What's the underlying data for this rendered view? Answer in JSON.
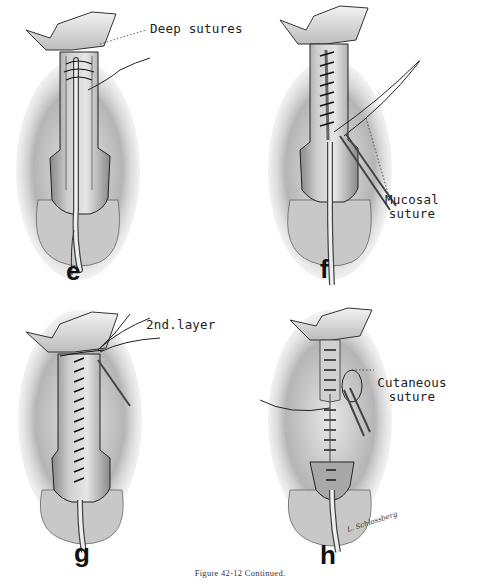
{
  "figure": {
    "caption": "Figure 42-12 Continued.",
    "panels": [
      {
        "id": "e",
        "letter": "e",
        "annotation": "Deep sutures"
      },
      {
        "id": "f",
        "letter": "f",
        "annotation_line1": "Mucosal",
        "annotation_line2": "suture"
      },
      {
        "id": "g",
        "letter": "g",
        "annotation": "2nd.layer"
      },
      {
        "id": "h",
        "letter": "h",
        "annotation_line1": "Cutaneous",
        "annotation_line2": "suture",
        "signature": "L. Schlossberg"
      }
    ]
  },
  "colors": {
    "background": "#ffffff",
    "ink": "#1a1a1a",
    "tissue_shadow": "#9a9a9a",
    "tissue_light": "#d8d8d8"
  }
}
